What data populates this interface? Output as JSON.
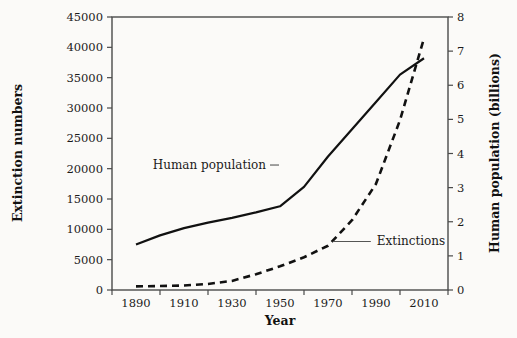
{
  "chart_data": {
    "type": "line",
    "title": "",
    "xlabel": "Year",
    "ylabel": "Extinction numbers",
    "y2label": "Human population (billions)",
    "xlim": [
      1880,
      2020
    ],
    "ylim": [
      0,
      45000
    ],
    "y2lim": [
      0,
      8
    ],
    "grid": false,
    "legend": "annotations-inline",
    "x_ticks": [
      "1890",
      "1910",
      "1930",
      "1950",
      "1970",
      "1990",
      "2010"
    ],
    "x_tick_values": [
      1890,
      1910,
      1930,
      1950,
      1970,
      1990,
      2010
    ],
    "y_ticks": [
      "0",
      "5000",
      "10000",
      "15000",
      "20000",
      "25000",
      "30000",
      "35000",
      "40000",
      "45000"
    ],
    "y_tick_values": [
      0,
      5000,
      10000,
      15000,
      20000,
      25000,
      30000,
      35000,
      40000,
      45000
    ],
    "y2_ticks": [
      "0",
      "1",
      "2",
      "3",
      "4",
      "5",
      "6",
      "7",
      "8"
    ],
    "y2_tick_values": [
      0,
      1,
      2,
      3,
      4,
      5,
      6,
      7,
      8
    ],
    "series": [
      {
        "name": "Human population",
        "style": "solid",
        "axis": "left",
        "color": "#111111",
        "x": [
          1890,
          1900,
          1910,
          1920,
          1930,
          1940,
          1950,
          1960,
          1970,
          1980,
          1990,
          2000,
          2010
        ],
        "values": [
          7500,
          9000,
          10200,
          11100,
          11900,
          12800,
          13800,
          17000,
          22000,
          26500,
          31000,
          35500,
          38200
        ]
      },
      {
        "name": "Extinctions",
        "style": "dashed",
        "axis": "left",
        "color": "#111111",
        "x": [
          1890,
          1900,
          1910,
          1920,
          1930,
          1940,
          1950,
          1960,
          1970,
          1980,
          1990,
          2000,
          2010
        ],
        "values": [
          600,
          650,
          750,
          1000,
          1500,
          2600,
          3900,
          5400,
          7300,
          11500,
          17500,
          28000,
          41500
        ]
      }
    ],
    "annotations": [
      {
        "text": "Human population",
        "anchor_x": 1930,
        "anchor_y": 21000
      },
      {
        "text": "Extinctions",
        "anchor_x": 1976,
        "anchor_y": 8200
      }
    ]
  },
  "axes": {
    "x_title": "Year",
    "y_left_title": "Extinction numbers",
    "y_right_title": "Human population (billions)"
  },
  "labels": {
    "annotation_population": "Human population",
    "annotation_extinctions": "Extinctions"
  }
}
